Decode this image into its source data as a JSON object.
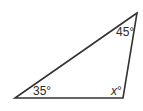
{
  "diagram": {
    "type": "triangle",
    "vertices": {
      "top": {
        "x": 137,
        "y": 13
      },
      "bottom_left": {
        "x": 15,
        "y": 98
      },
      "bottom_right": {
        "x": 123,
        "y": 98
      }
    },
    "stroke_color": "#333333",
    "angles": {
      "top": {
        "label": "45°",
        "x": 116,
        "y": 36
      },
      "bottom_left": {
        "label": "35°",
        "x": 33,
        "y": 95
      },
      "bottom_right": {
        "label": "°",
        "variable": "x",
        "x": 111,
        "y": 95
      }
    }
  }
}
